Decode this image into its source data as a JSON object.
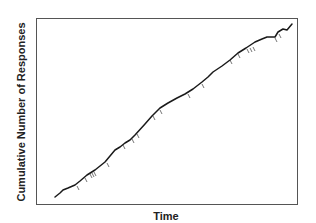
{
  "chart_data": {
    "type": "line",
    "title": "",
    "xlabel": "Time",
    "ylabel": "Cumulative Number of Responses",
    "grid": false,
    "legend": null,
    "x_ticks": [],
    "y_ticks": [],
    "frame": {
      "x0": 36,
      "y0": 18,
      "x1": 297,
      "y1": 204
    },
    "series": [
      {
        "name": "cumulative responses",
        "color": "#1a1a1a",
        "points": [
          [
            55,
            197
          ],
          [
            60,
            193
          ],
          [
            63,
            190
          ],
          [
            68,
            188
          ],
          [
            75,
            185
          ],
          [
            80,
            181
          ],
          [
            87,
            175
          ],
          [
            95,
            170
          ],
          [
            105,
            162
          ],
          [
            110,
            156
          ],
          [
            115,
            150
          ],
          [
            120,
            147
          ],
          [
            125,
            143
          ],
          [
            130,
            140
          ],
          [
            135,
            135
          ],
          [
            145,
            124
          ],
          [
            152,
            116
          ],
          [
            160,
            108
          ],
          [
            168,
            103
          ],
          [
            177,
            98
          ],
          [
            185,
            94
          ],
          [
            193,
            89
          ],
          [
            202,
            82
          ],
          [
            208,
            77
          ],
          [
            213,
            72
          ],
          [
            222,
            66
          ],
          [
            230,
            60
          ],
          [
            238,
            53
          ],
          [
            246,
            48
          ],
          [
            255,
            42
          ],
          [
            262,
            39
          ],
          [
            267,
            37
          ],
          [
            275,
            37
          ],
          [
            278,
            32
          ],
          [
            283,
            29
          ],
          [
            287,
            30
          ],
          [
            292,
            24
          ]
        ]
      }
    ],
    "pips": [
      [
        77,
        185
      ],
      [
        85,
        177
      ],
      [
        90,
        173
      ],
      [
        92,
        172
      ],
      [
        94,
        171
      ],
      [
        107,
        162
      ],
      [
        123,
        144
      ],
      [
        132,
        138
      ],
      [
        137,
        133
      ],
      [
        153,
        115
      ],
      [
        160,
        109
      ],
      [
        188,
        93
      ],
      [
        202,
        83
      ],
      [
        230,
        59
      ],
      [
        238,
        53
      ],
      [
        247,
        48
      ],
      [
        250,
        47
      ],
      [
        253,
        46
      ],
      [
        275,
        37
      ],
      [
        279,
        33
      ]
    ],
    "colors": {
      "frame": "#555555",
      "line": "#1a1a1a",
      "pip": "#666666"
    }
  }
}
